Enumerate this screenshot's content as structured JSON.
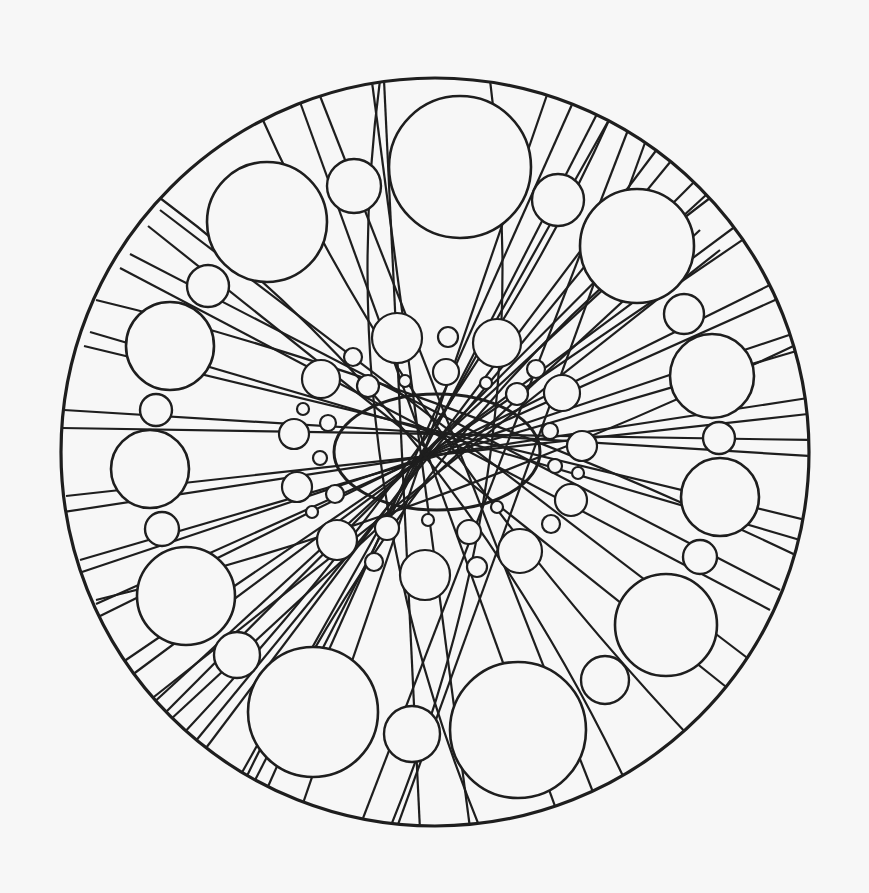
{
  "drawing": {
    "kind": "mandala-line-art",
    "background": "#f7f7f7",
    "ink": "#1e1e1e",
    "outer_circle": {
      "cx": 435,
      "cy": 452,
      "r": 374
    },
    "center_ellipse": {
      "cx": 437,
      "cy": 452,
      "rx": 103,
      "ry": 58
    },
    "big_circles": [
      {
        "cx": 460,
        "cy": 167,
        "r": 71
      },
      {
        "cx": 267,
        "cy": 222,
        "r": 60
      },
      {
        "cx": 637,
        "cy": 246,
        "r": 57
      },
      {
        "cx": 170,
        "cy": 346,
        "r": 44
      },
      {
        "cx": 712,
        "cy": 376,
        "r": 42
      },
      {
        "cx": 150,
        "cy": 469,
        "r": 39
      },
      {
        "cx": 720,
        "cy": 497,
        "r": 39
      },
      {
        "cx": 186,
        "cy": 596,
        "r": 49
      },
      {
        "cx": 666,
        "cy": 625,
        "r": 51
      },
      {
        "cx": 313,
        "cy": 712,
        "r": 65
      },
      {
        "cx": 518,
        "cy": 730,
        "r": 68
      }
    ],
    "medium_circles": [
      {
        "cx": 354,
        "cy": 186,
        "r": 27
      },
      {
        "cx": 558,
        "cy": 200,
        "r": 26
      },
      {
        "cx": 208,
        "cy": 286,
        "r": 21
      },
      {
        "cx": 684,
        "cy": 314,
        "r": 20
      },
      {
        "cx": 156,
        "cy": 410,
        "r": 16
      },
      {
        "cx": 719,
        "cy": 438,
        "r": 16
      },
      {
        "cx": 162,
        "cy": 529,
        "r": 17
      },
      {
        "cx": 700,
        "cy": 557,
        "r": 17
      },
      {
        "cx": 237,
        "cy": 655,
        "r": 23
      },
      {
        "cx": 605,
        "cy": 680,
        "r": 24
      },
      {
        "cx": 412,
        "cy": 734,
        "r": 28
      }
    ],
    "inner_ring_circles": [
      {
        "cx": 397,
        "cy": 338,
        "r": 25
      },
      {
        "cx": 497,
        "cy": 343,
        "r": 24
      },
      {
        "cx": 321,
        "cy": 379,
        "r": 19
      },
      {
        "cx": 562,
        "cy": 393,
        "r": 18
      },
      {
        "cx": 294,
        "cy": 434,
        "r": 15
      },
      {
        "cx": 582,
        "cy": 446,
        "r": 15
      },
      {
        "cx": 297,
        "cy": 487,
        "r": 15
      },
      {
        "cx": 571,
        "cy": 500,
        "r": 16
      },
      {
        "cx": 337,
        "cy": 540,
        "r": 20
      },
      {
        "cx": 520,
        "cy": 551,
        "r": 22
      },
      {
        "cx": 425,
        "cy": 575,
        "r": 25
      },
      {
        "cx": 446,
        "cy": 372,
        "r": 13
      },
      {
        "cx": 448,
        "cy": 337,
        "r": 10
      },
      {
        "cx": 353,
        "cy": 357,
        "r": 9
      },
      {
        "cx": 368,
        "cy": 386,
        "r": 11
      },
      {
        "cx": 517,
        "cy": 394,
        "r": 11
      },
      {
        "cx": 536,
        "cy": 369,
        "r": 9
      },
      {
        "cx": 328,
        "cy": 423,
        "r": 8
      },
      {
        "cx": 550,
        "cy": 431,
        "r": 8
      },
      {
        "cx": 320,
        "cy": 458,
        "r": 7
      },
      {
        "cx": 555,
        "cy": 466,
        "r": 7
      },
      {
        "cx": 335,
        "cy": 494,
        "r": 9
      },
      {
        "cx": 551,
        "cy": 524,
        "r": 9
      },
      {
        "cx": 387,
        "cy": 528,
        "r": 12
      },
      {
        "cx": 469,
        "cy": 532,
        "r": 12
      },
      {
        "cx": 374,
        "cy": 562,
        "r": 9
      },
      {
        "cx": 477,
        "cy": 567,
        "r": 10
      },
      {
        "cx": 303,
        "cy": 409,
        "r": 6
      },
      {
        "cx": 312,
        "cy": 512,
        "r": 6
      },
      {
        "cx": 405,
        "cy": 381,
        "r": 6
      },
      {
        "cx": 486,
        "cy": 383,
        "r": 6
      },
      {
        "cx": 428,
        "cy": 520,
        "r": 6
      },
      {
        "cx": 497,
        "cy": 507,
        "r": 6
      },
      {
        "cx": 578,
        "cy": 473,
        "r": 6
      }
    ],
    "lines": [
      [
        300,
        102,
        560,
        820
      ],
      [
        320,
        96,
        600,
        810
      ],
      [
        372,
        82,
        470,
        828
      ],
      [
        384,
        80,
        420,
        830
      ],
      [
        548,
        92,
        300,
        812
      ],
      [
        574,
        100,
        262,
        800
      ],
      [
        628,
        130,
        360,
        826
      ],
      [
        646,
        140,
        396,
        830
      ],
      [
        148,
        226,
        730,
        690
      ],
      [
        160,
        210,
        750,
        660
      ],
      [
        120,
        268,
        770,
        610
      ],
      [
        130,
        254,
        780,
        590
      ],
      [
        90,
        332,
        800,
        540
      ],
      [
        84,
        346,
        806,
        520
      ],
      [
        64,
        410,
        810,
        456
      ],
      [
        62,
        428,
        810,
        440
      ],
      [
        66,
        496,
        808,
        414
      ],
      [
        64,
        512,
        808,
        398
      ],
      [
        80,
        560,
        800,
        350
      ],
      [
        76,
        574,
        798,
        332
      ],
      [
        96,
        604,
        784,
        296
      ],
      [
        92,
        620,
        780,
        280
      ],
      [
        120,
        664,
        760,
        228
      ],
      [
        128,
        678,
        752,
        214
      ],
      [
        150,
        706,
        718,
        184
      ],
      [
        160,
        718,
        706,
        170
      ],
      [
        190,
        748,
        680,
        150
      ],
      [
        200,
        756,
        664,
        140
      ],
      [
        240,
        776,
        610,
        118
      ],
      [
        252,
        786,
        598,
        112
      ],
      [
        700,
        230,
        170,
        720
      ],
      [
        720,
        250,
        150,
        700
      ]
    ],
    "arcs": [
      "M 262 118 Q 400 430 700 748",
      "M 610 118 Q 470 430 170 748",
      "M 96 300 Q 430 380 806 560",
      "M 96 600 Q 430 520 806 340",
      "M 380 80 Q 330 460 480 828",
      "M 490 80 Q 540 460 390 828",
      "M 160 198 Q 460 420 640 812",
      "M 710 198 Q 410 420 230 812"
    ]
  }
}
